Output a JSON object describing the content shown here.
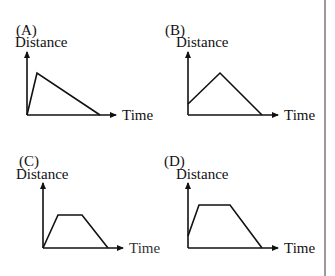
{
  "graphs": [
    {
      "option": "(A)",
      "y_label": "Distance",
      "x_label": "Time",
      "shape": "quick rise from zero to peak, then slower linear fall back to zero",
      "points": [
        [
          27,
          115
        ],
        [
          37,
          73
        ],
        [
          100,
          115
        ]
      ]
    },
    {
      "option": "(B)",
      "y_label": "Distance",
      "x_label": "Time",
      "shape": "starts above zero, linear rise to peak, linear fall to zero",
      "points": [
        [
          188,
          104
        ],
        [
          220,
          73
        ],
        [
          262,
          115
        ]
      ]
    },
    {
      "option": "(C)",
      "y_label": "Distance",
      "x_label": "Time",
      "shape": "rise from zero, flat plateau, fall to zero",
      "points": [
        [
          43,
          248
        ],
        [
          58,
          215
        ],
        [
          82,
          215
        ],
        [
          108,
          248
        ]
      ]
    },
    {
      "option": "(D)",
      "y_label": "Distance",
      "x_label": "Time",
      "shape": "starts above zero, rise, long flat plateau, fall to zero",
      "points": [
        [
          188,
          236
        ],
        [
          199,
          205
        ],
        [
          230,
          205
        ],
        [
          262,
          248
        ]
      ]
    }
  ],
  "colors": {
    "line": "#111111",
    "border": "#9a9a9a"
  }
}
